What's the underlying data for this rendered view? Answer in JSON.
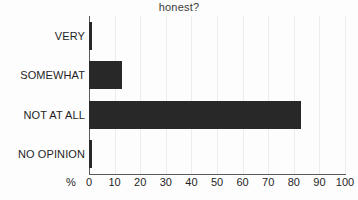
{
  "chart_data": {
    "type": "bar",
    "orientation": "horizontal",
    "title": "honest?",
    "xlabel": "%",
    "ylabel": "",
    "categories": [
      "VERY",
      "SOMEWHAT",
      "NOT AT ALL",
      "NO OPINION"
    ],
    "values": [
      1,
      13,
      83,
      1
    ],
    "xlim": [
      0,
      100
    ],
    "xticks": [
      0,
      10,
      20,
      30,
      40,
      50,
      60,
      70,
      80,
      90,
      100
    ],
    "xtick_labels": [
      "0",
      "10",
      "20",
      "30",
      "40",
      "50",
      "60",
      "70",
      "80",
      "90",
      "100"
    ],
    "grid": true,
    "grid_axis": "x",
    "legend": false,
    "series": [
      {
        "name": "",
        "values": [
          1,
          13,
          83,
          1
        ]
      }
    ]
  },
  "style": {
    "bar_color": "#282828",
    "grid_color": "#ececec",
    "axis_color": "#5a5a5a",
    "background": "#fdfdfd",
    "text_color": "#1f1f1f",
    "title_color": "#3a3a3a"
  }
}
